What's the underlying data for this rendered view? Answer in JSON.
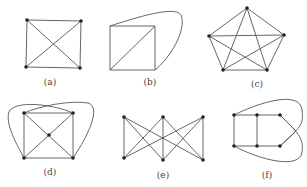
{
  "figure": {
    "panels": [
      {
        "id": "a",
        "label": "(a)"
      },
      {
        "id": "b",
        "label": "(b)"
      },
      {
        "id": "c",
        "label": "(c)"
      },
      {
        "id": "d",
        "label": "(d)"
      },
      {
        "id": "e",
        "label": "(e)"
      },
      {
        "id": "f",
        "label": "(f)"
      }
    ]
  },
  "colors": {
    "edge": "#555555",
    "vertex": "#222222",
    "label": "#444444",
    "background": "#ffffff"
  }
}
